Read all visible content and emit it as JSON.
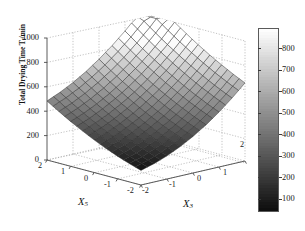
{
  "figure": {
    "kind": "matlab-3d-surface",
    "background": "#ffffff",
    "axis_color": "#555555",
    "grid_color": "#aaaaaa",
    "grid": "dotted"
  },
  "axes": {
    "z": {
      "label_main": "Total Drying Time T",
      "label_sub": "f",
      "label_tail": "/min",
      "ticks": [
        "1000",
        "800",
        "600",
        "400",
        "200",
        "0"
      ],
      "range": [
        0,
        1000
      ]
    },
    "x5": {
      "name": "X",
      "name_sub": "5",
      "ticks": [
        "2",
        "1",
        "0",
        "-1",
        "-2"
      ],
      "range": [
        -2,
        2
      ]
    },
    "x3": {
      "name": "X",
      "name_sub": "3",
      "ticks": [
        "-2",
        "-1",
        "0",
        "1",
        "2"
      ],
      "range": [
        -2,
        2
      ]
    }
  },
  "colorbar": {
    "ticks": [
      "800",
      "700",
      "600",
      "500",
      "400",
      "300",
      "200",
      "100"
    ],
    "min": 100,
    "max": 860,
    "low_color": "#0d0d0d",
    "high_color": "#ffffff"
  },
  "chart_data": {
    "type": "surface",
    "title": "",
    "xlabel": "X3",
    "ylabel": "X5",
    "zlabel": "Total Drying Time Tf/min",
    "xlim": [
      -2,
      2
    ],
    "ylim": [
      -2,
      2
    ],
    "zlim": [
      0,
      1000
    ],
    "grid": true,
    "legend": "colorbar-right",
    "x3_values": [
      -2,
      -1.5,
      -1,
      -0.5,
      0,
      0.5,
      1,
      1.5,
      2
    ],
    "x5_values": [
      -2,
      -1.5,
      -1,
      -0.5,
      0,
      0.5,
      1,
      1.5,
      2
    ],
    "z_matrix": [
      [
        120,
        150,
        190,
        240,
        300,
        370,
        450,
        540,
        640
      ],
      [
        150,
        182,
        224,
        276,
        338,
        410,
        492,
        584,
        686
      ],
      [
        185,
        219,
        263,
        317,
        381,
        455,
        539,
        633,
        737
      ],
      [
        224,
        260,
        306,
        362,
        428,
        504,
        590,
        686,
        792
      ],
      [
        268,
        306,
        354,
        412,
        480,
        558,
        646,
        744,
        852
      ],
      [
        316,
        356,
        406,
        466,
        536,
        616,
        706,
        806,
        916
      ],
      [
        368,
        410,
        462,
        524,
        596,
        678,
        770,
        872,
        984
      ],
      [
        424,
        468,
        522,
        586,
        660,
        744,
        838,
        942,
        1056
      ],
      [
        484,
        530,
        586,
        652,
        728,
        814,
        910,
        1016,
        1132
      ]
    ],
    "z_note": "surface rises from dark minimum near (X3=-2, X5=-2) front corner to light maximum at far back corner"
  }
}
